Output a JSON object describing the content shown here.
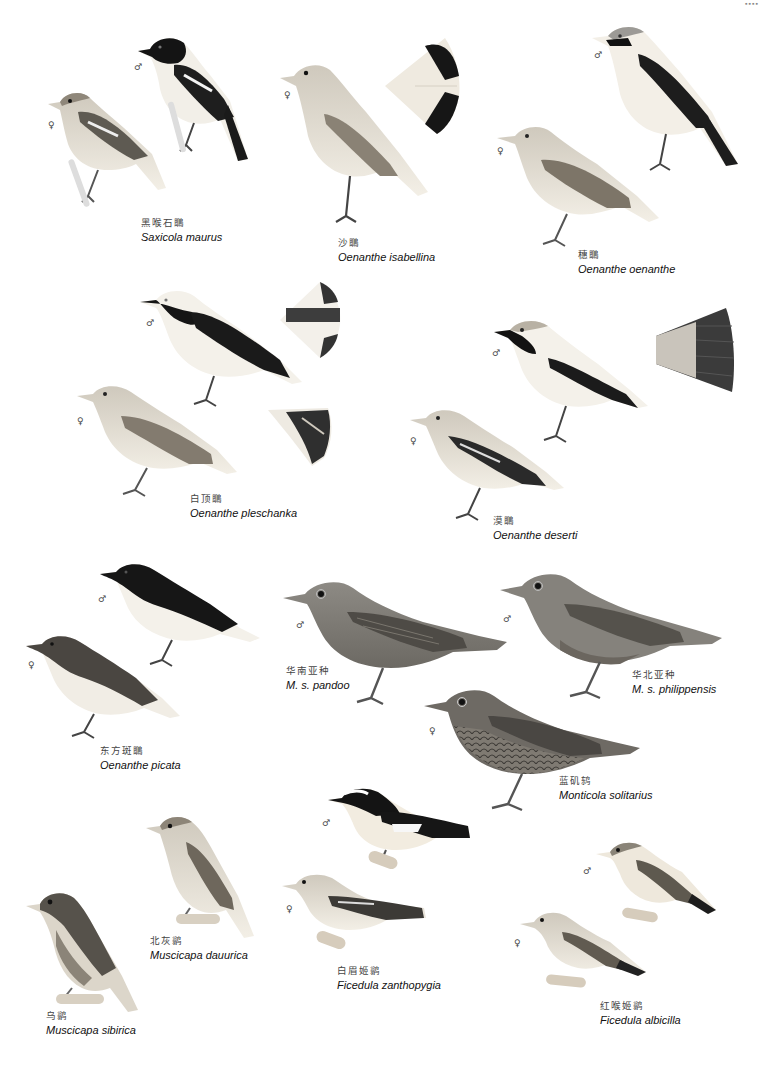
{
  "page": {
    "header_mark": "▪▪▪▪",
    "colors": {
      "background": "#ffffff",
      "ink_dark": "#1a1a1a",
      "plumage_grey": "#8a8780",
      "plumage_light": "#e9e4d8",
      "caption_cn": "#444444",
      "caption_latin": "#111111"
    }
  },
  "sex_symbols": {
    "male": "♂",
    "female": "♀"
  },
  "species": [
    {
      "id": "saxicola-maurus",
      "cn": "黑喉石䳭",
      "latin": "Saxicola maurus",
      "figures": [
        "♀",
        "♂"
      ]
    },
    {
      "id": "oenanthe-isabellina",
      "cn": "沙䳭",
      "latin": "Oenanthe isabellina",
      "figures": [
        "♀"
      ]
    },
    {
      "id": "oenanthe-oenanthe",
      "cn": "穗䳭",
      "latin": "Oenanthe oenanthe",
      "figures": [
        "♂",
        "♀"
      ]
    },
    {
      "id": "oenanthe-pleschanka",
      "cn": "白顶䳭",
      "latin": "Oenanthe pleschanka",
      "figures": [
        "♂",
        "♀"
      ]
    },
    {
      "id": "oenanthe-deserti",
      "cn": "漠䳭",
      "latin": "Oenanthe deserti",
      "figures": [
        "♂",
        "♀"
      ]
    },
    {
      "id": "oenanthe-picata",
      "cn": "东方斑䳭",
      "latin": "Oenanthe picata",
      "figures": [
        "♂",
        "♀"
      ]
    },
    {
      "id": "monticola-pandoo",
      "cn": "华南亚种",
      "latin": "M. s. pandoo",
      "figures": [
        "♂"
      ]
    },
    {
      "id": "monticola-philippensis",
      "cn": "华北亚种",
      "latin": "M. s. philippensis",
      "figures": [
        "♂"
      ]
    },
    {
      "id": "monticola-solitarius",
      "cn": "蓝矶鸫",
      "latin": "Monticola solitarius",
      "figures": [
        "♀"
      ]
    },
    {
      "id": "muscicapa-dauurica",
      "cn": "北灰鹟",
      "latin": "Muscicapa dauurica",
      "figures": []
    },
    {
      "id": "ficedula-zanthopygia",
      "cn": "白眉姬鹟",
      "latin": "Ficedula zanthopygia",
      "figures": [
        "♂",
        "♀"
      ]
    },
    {
      "id": "muscicapa-sibirica",
      "cn": "乌鹟",
      "latin": "Muscicapa sibirica",
      "figures": []
    },
    {
      "id": "ficedula-albicilla",
      "cn": "红喉姬鹟",
      "latin": "Ficedula albicilla",
      "figures": [
        "♂",
        "♀"
      ]
    }
  ]
}
